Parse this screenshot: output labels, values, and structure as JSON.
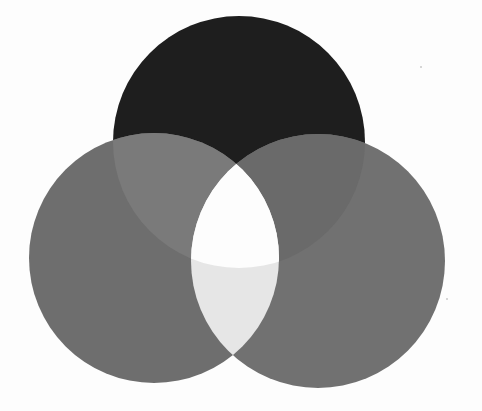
{
  "diagram": {
    "type": "three-circle-venn",
    "background_color": "#fdfdfd",
    "circles": [
      {
        "id": "top",
        "cx": 239,
        "cy": 142,
        "r": 126,
        "color": "#1e1e1e"
      },
      {
        "id": "left",
        "cx": 154,
        "cy": 258,
        "r": 125,
        "color": "#6e6e6e"
      },
      {
        "id": "right",
        "cx": 318,
        "cy": 261,
        "r": 127,
        "color": "#717171"
      }
    ],
    "overlap_colors": {
      "top_left": "#7a7a7a",
      "top_right": "#6a6a6a",
      "left_right": "#e6e6e6",
      "all_three": "#fdfdfd"
    },
    "labels": []
  }
}
